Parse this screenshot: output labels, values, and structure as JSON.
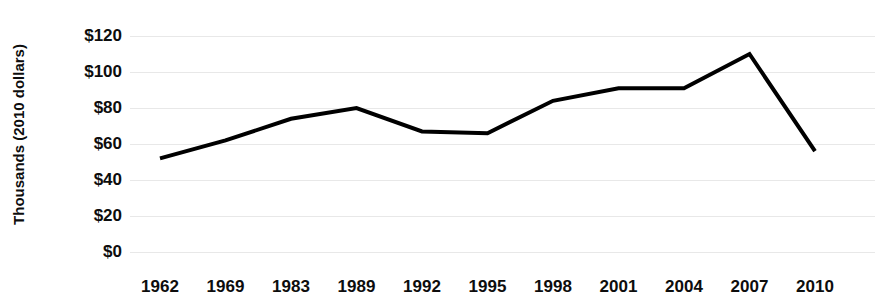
{
  "chart_data": {
    "type": "line",
    "title": "",
    "xlabel": "",
    "ylabel": "Thousands (2010 dollars)",
    "categories": [
      "1962",
      "1969",
      "1983",
      "1989",
      "1992",
      "1995",
      "1998",
      "2001",
      "2004",
      "2007",
      "2010"
    ],
    "values": [
      52,
      62,
      74,
      80,
      67,
      66,
      84,
      91,
      91,
      110,
      56
    ],
    "series": [
      {
        "name": "Median family net worth",
        "values": [
          52,
          62,
          74,
          80,
          67,
          66,
          84,
          91,
          91,
          110,
          56
        ]
      }
    ],
    "ylim": [
      0,
      120
    ],
    "ytick_values": [
      0,
      20,
      40,
      60,
      80,
      100,
      120
    ],
    "ytick_labels": [
      "$0",
      "$20",
      "$40",
      "$60",
      "$80",
      "$100",
      "$120"
    ],
    "grid": true,
    "grid_axis": "y",
    "legend": false,
    "legend_position": "none",
    "line_color": "#000000",
    "line_width": 4,
    "markers": false,
    "background_color": "#ffffff",
    "grid_color": "#e8e8e8",
    "text_color": "#0d0d0d"
  }
}
